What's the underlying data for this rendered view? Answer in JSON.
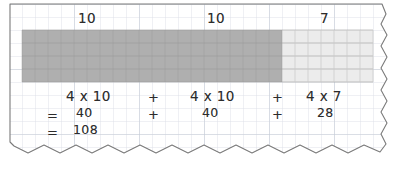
{
  "worksheet": {
    "paper": {
      "background_color": "#ffffff",
      "grid_line_color": "#d9dde6",
      "grid_major_line_color": "#c3c9d6",
      "edge_color": "#7a7a7a",
      "grid_cell_px": 13
    },
    "array_model": {
      "rows": 4,
      "total_columns": 27,
      "segments": [
        {
          "name": "segment-1",
          "columns": 10,
          "label": "10",
          "fill_color": "#b0b0b0"
        },
        {
          "name": "segment-2",
          "columns": 10,
          "label": "10",
          "fill_color": "#b0b0b0"
        },
        {
          "name": "segment-3",
          "columns": 7,
          "label": "7",
          "fill_color": "#ececec"
        }
      ],
      "column_labels": [
        "10",
        "10",
        "7"
      ]
    },
    "equations": {
      "row_products": {
        "terms": [
          "4 x 10",
          "4 x 10",
          "4 x 7"
        ],
        "operators": [
          "+",
          "+"
        ],
        "times_symbol": "x"
      },
      "row_sums": {
        "equals_sign": "=",
        "terms": [
          "40",
          "40",
          "28"
        ],
        "operators": [
          "+",
          "+"
        ]
      },
      "row_total": {
        "equals_sign": "=",
        "value": "108"
      }
    }
  }
}
